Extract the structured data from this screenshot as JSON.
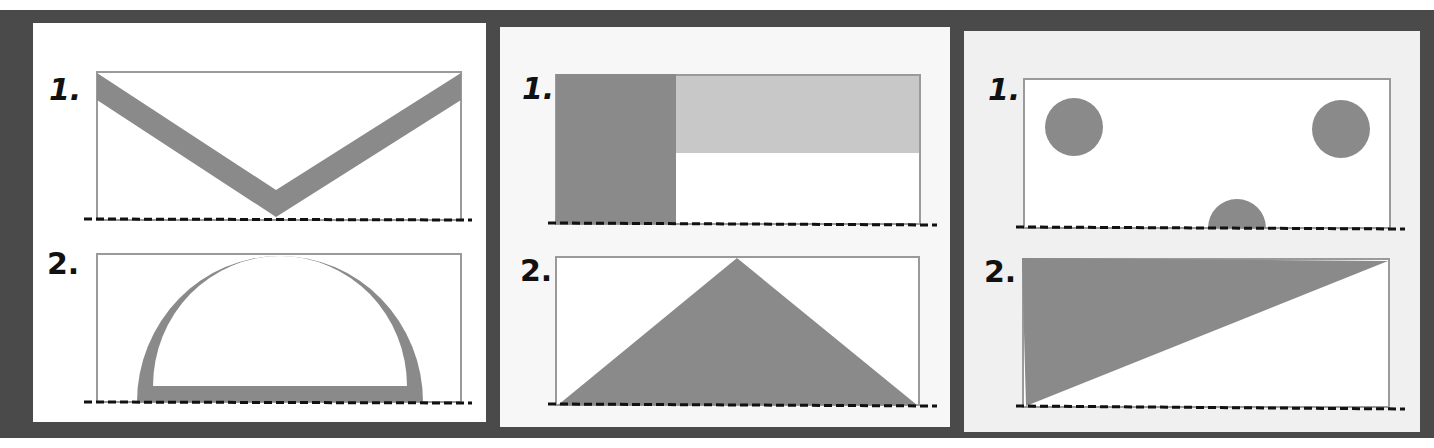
{
  "colors": {
    "frame": "#4a4a4a",
    "shape_fill": "#8a8a8a",
    "shape_fill_light": "#c8c8c8",
    "rect_border": "#999999",
    "ground_line": "#111111"
  },
  "panels": [
    {
      "id": "panel-1",
      "figures": [
        {
          "label": "1.",
          "shape": "v-shaped band from top corners to bottom center"
        },
        {
          "label": "2.",
          "shape": "semicircular arch band resting on ground"
        }
      ]
    },
    {
      "id": "panel-2",
      "figures": [
        {
          "label": "1.",
          "shape": "dark left rectangle with light upper-right rectangle"
        },
        {
          "label": "2.",
          "shape": "isosceles triangle from ground corners to top center"
        }
      ]
    },
    {
      "id": "panel-3",
      "figures": [
        {
          "label": "1.",
          "shape": "two upper circles and a half circle on ground"
        },
        {
          "label": "2.",
          "shape": "right triangle filling upper-left diagonal half"
        }
      ]
    }
  ]
}
